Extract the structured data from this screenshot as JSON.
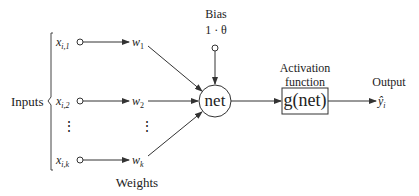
{
  "diagram": {
    "inputs_label": "Inputs",
    "weights_label": "Weights",
    "bias_label": "Bias",
    "bias_value": "1 · θ",
    "net_label": "net",
    "activation_label_line1": "Activation",
    "activation_label_line2": "function",
    "activation_expr": "g(net)",
    "output_label": "Output",
    "output_symbol": "ŷ",
    "output_subscript": "i",
    "inputs": [
      {
        "symbol": "x",
        "subscript": "i,1",
        "weight": "w",
        "weight_sub": "1"
      },
      {
        "symbol": "x",
        "subscript": "i,2",
        "weight": "w",
        "weight_sub": "2"
      },
      {
        "symbol": "x",
        "subscript": "i,k",
        "weight": "w",
        "weight_sub": "k"
      }
    ],
    "ellipsis": "⋮"
  },
  "colors": {
    "stroke": "#333333",
    "background": "#ffffff"
  }
}
